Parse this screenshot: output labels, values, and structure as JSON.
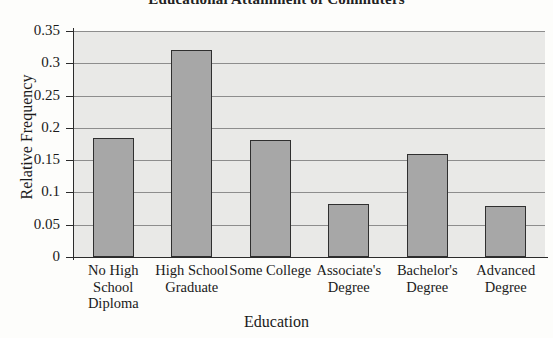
{
  "chart_data": {
    "type": "bar",
    "title": "Educational Attainment of Commuters",
    "xlabel": "Education",
    "ylabel": "Relative Frequency",
    "categories": [
      "No High School Diploma",
      "High School Graduate",
      "Some College",
      "Associate's Degree",
      "Bachelor's Degree",
      "Advanced Degree"
    ],
    "values": [
      0.185,
      0.32,
      0.181,
      0.082,
      0.159,
      0.079
    ],
    "ylim": [
      0,
      0.35
    ],
    "yticks": [
      0,
      0.05,
      0.1,
      0.15,
      0.2,
      0.25,
      0.3,
      0.35
    ],
    "ytick_labels": [
      "0",
      "0.05",
      "0.1",
      "0.15",
      "0.2",
      "0.25",
      "0.3",
      "0.35"
    ],
    "grid": "horizontal",
    "legend": "none",
    "colors": {
      "bar_fill": "#a7a7a7",
      "bar_edge": "#2f2f2f",
      "plot_background": "#e9e9e7",
      "gridline": "#8d8d8d",
      "axis": "#2b2b2b",
      "text": "#1a1a1a"
    }
  }
}
